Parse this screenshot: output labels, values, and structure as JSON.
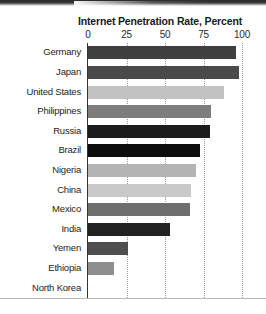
{
  "chart_data": {
    "type": "bar",
    "orientation": "horizontal",
    "title": "Internet Penetration Rate, Percent",
    "xlabel": "",
    "ylabel": "",
    "xlim": [
      0,
      100
    ],
    "xticks": [
      "0",
      "25",
      "50",
      "75",
      "100"
    ],
    "xtick_values": [
      0,
      25,
      50,
      75,
      100
    ],
    "grid": "vertical-dotted",
    "legend": "none",
    "categories": [
      "Germany",
      "Japan",
      "United States",
      "Philippines",
      "Russia",
      "Brazil",
      "Nigeria",
      "China",
      "Mexico",
      "India",
      "Yemen",
      "Ethiopia",
      "North Korea"
    ],
    "values": [
      96,
      98,
      88,
      80,
      79,
      73,
      70,
      67,
      66,
      53,
      26,
      17,
      0
    ],
    "bar_colors": [
      "#3f3f3f",
      "#4a4a4a",
      "#c2c2c2",
      "#7d7d7d",
      "#1c1c1c",
      "#0d0d0d",
      "#b4b4b4",
      "#c9c9c9",
      "#6e6e6e",
      "#222222",
      "#4f4f4f",
      "#8e8e8e",
      "#777777"
    ]
  },
  "axis": {
    "tick_color": "#2a2a2a",
    "line_color": "#333333",
    "gridline_color": "#9a9a9a"
  }
}
